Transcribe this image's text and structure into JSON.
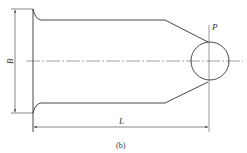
{
  "diagram": {
    "labels": {
      "width_dim": "B",
      "length_dim": "L",
      "point": "P",
      "caption": "(b)"
    },
    "colors": {
      "line": "#333333",
      "background": "#ffffff"
    }
  }
}
